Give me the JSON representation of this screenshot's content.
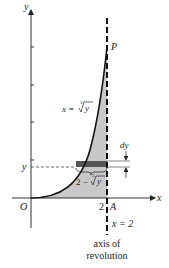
{
  "figure": {
    "type": "volume-of-revolution-diagram",
    "curve_label": "x = ∛y",
    "curve_label_parts": {
      "lhs": "x = ",
      "root_index": "3",
      "radicand": "y"
    },
    "point_top": "P",
    "point_axis": "A",
    "origin": "O",
    "x_axis_label": "x",
    "y_axis_label": "y",
    "y_level_label": "y",
    "x_tick_label": "2",
    "strip_thickness_label": "dy",
    "strip_length_label": "2 − ∛y",
    "strip_length_parts": {
      "lhs": "2 − ",
      "root_index": "3",
      "radicand": "y"
    },
    "axis_line_label": "x = 2",
    "axis_caption_line1": "axis of",
    "axis_caption_line2": "revolution",
    "colors": {
      "region_fill": "#c8c8c8",
      "strip_fill": "#555555",
      "ink": "#222222"
    }
  }
}
